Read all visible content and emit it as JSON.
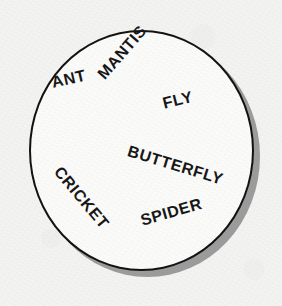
{
  "figure": {
    "type": "labelled-circle-set-diagram",
    "shape": "circle-outline",
    "background_color": "#f3f3f1",
    "fill_color": "#fbfbfa",
    "outline_color": "#111111",
    "shadow_color": "#9b9b9b",
    "label_color": "#151515"
  },
  "labels": [
    {
      "id": "ant",
      "text": "ANT",
      "rotation_deg": -13
    },
    {
      "id": "mantis",
      "text": "MANTIS",
      "rotation_deg": -49
    },
    {
      "id": "fly",
      "text": "FLY",
      "rotation_deg": -14
    },
    {
      "id": "butterfly",
      "text": "BUTTERFLY",
      "rotation_deg": 17
    },
    {
      "id": "cricket",
      "text": "CRICKET",
      "rotation_deg": 50
    },
    {
      "id": "spider",
      "text": "SPIDER",
      "rotation_deg": -16
    }
  ]
}
